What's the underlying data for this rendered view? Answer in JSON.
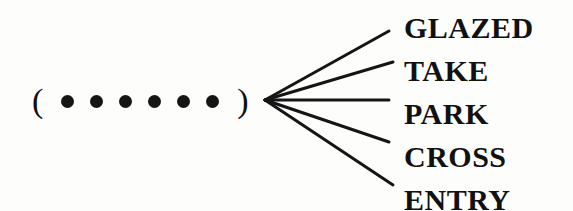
{
  "puzzle": {
    "open_paren": "(",
    "close_paren": ")",
    "blank_count": 6,
    "words": [
      "GLAZED",
      "TAKE",
      "PARK",
      "CROSS",
      "ENTRY"
    ]
  }
}
